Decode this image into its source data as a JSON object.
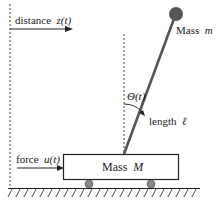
{
  "labels": {
    "distance": "distance",
    "distance_var": "z(t)",
    "mass_m": "Mass",
    "mass_m_var": "m",
    "theta": "Θ(t)",
    "length": "length",
    "length_var": "ℓ",
    "force": "force",
    "force_var": "u(t)",
    "mass_M": "Mass",
    "mass_M_var": "M"
  },
  "colors": {
    "line": "#222222",
    "rod": "#555555",
    "ball": "#555555",
    "wheel": "#888888"
  }
}
